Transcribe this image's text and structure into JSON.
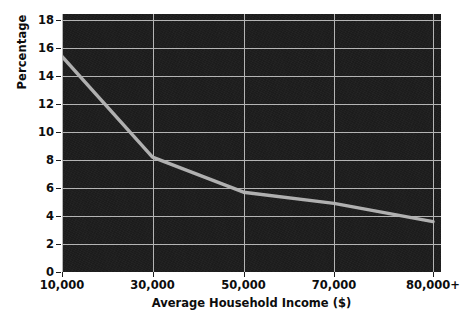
{
  "chart_data": {
    "type": "line",
    "title": "",
    "xlabel": "Average Household Income ($)",
    "ylabel": "Percentage",
    "x_tick_labels": [
      "10,000",
      "30,000",
      "50,000",
      "70,000",
      "80,000+"
    ],
    "x_tick_values": [
      10000,
      30000,
      50000,
      70000,
      80000
    ],
    "y_tick_labels": [
      "0",
      "2",
      "4",
      "6",
      "8",
      "10",
      "12",
      "14",
      "16",
      "18"
    ],
    "y_tick_values": [
      0,
      2,
      4,
      6,
      8,
      10,
      12,
      14,
      16,
      18
    ],
    "ylim": [
      0,
      18.7
    ],
    "xlim": [
      10000,
      81500
    ],
    "grid": "both",
    "legend": "none",
    "series": [
      {
        "name": "Percentage",
        "color": "#b0b0b0",
        "x": [
          10000,
          30000,
          50000,
          70000,
          80000
        ],
        "values": [
          15.4,
          8.2,
          5.7,
          4.9,
          3.6
        ]
      }
    ],
    "style": {
      "plot_background": "#1c1c1c",
      "gridline_color": "#b4b4b4",
      "line_color": "#b0b0b0",
      "text_color": "#0d0d0d",
      "figure_background": "#ffffff"
    }
  }
}
